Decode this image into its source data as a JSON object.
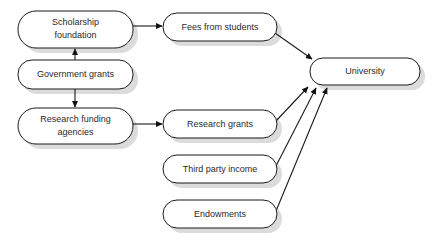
{
  "diagram": {
    "type": "flowchart",
    "background_color": "#ffffff",
    "node_fill_color": "#ffffff",
    "node_border_color": "#1b1b1b",
    "node_shadow_color": "#cfcfcf",
    "text_color": "#2a2a2a",
    "arrow_color": "#111111",
    "nodes": [
      {
        "id": "scholarship-foundation",
        "label_line1": "Scholarship",
        "label_line2": "foundation",
        "lines": 2,
        "x": 18,
        "y": 11,
        "width": 115,
        "height": 37,
        "radius": 18
      },
      {
        "id": "government-grants",
        "label_line1": "Government grants",
        "label_line2": "",
        "lines": 1,
        "x": 18,
        "y": 60,
        "width": 115,
        "height": 29,
        "radius": 14
      },
      {
        "id": "research-funding-agencies",
        "label_line1": "Research funding",
        "label_line2": "agencies",
        "lines": 2,
        "x": 18,
        "y": 108,
        "width": 115,
        "height": 36,
        "radius": 18
      },
      {
        "id": "fees-from-students",
        "label_line1": "Fees from students",
        "label_line2": "",
        "lines": 1,
        "x": 163,
        "y": 13,
        "width": 114,
        "height": 28,
        "radius": 14
      },
      {
        "id": "research-grants",
        "label_line1": "Research grants",
        "label_line2": "",
        "lines": 1,
        "x": 163,
        "y": 110,
        "width": 114,
        "height": 28,
        "radius": 14
      },
      {
        "id": "third-party-income",
        "label_line1": "Third party income",
        "label_line2": "",
        "lines": 1,
        "x": 163,
        "y": 155,
        "width": 114,
        "height": 28,
        "radius": 14
      },
      {
        "id": "endowments",
        "label_line1": "Endowments",
        "label_line2": "",
        "lines": 1,
        "x": 163,
        "y": 200,
        "width": 114,
        "height": 28,
        "radius": 14
      },
      {
        "id": "university",
        "label_line1": "University",
        "label_line2": "",
        "lines": 1,
        "x": 310,
        "y": 58,
        "width": 110,
        "height": 27,
        "radius": 13
      }
    ],
    "edges": [
      {
        "id": "government-grants-to-scholarship-foundation",
        "from": "government-grants",
        "to": "scholarship-foundation",
        "direction": "up",
        "x1": 75,
        "y1": 60,
        "x2": 75,
        "y2": 48
      },
      {
        "id": "government-grants-to-research-funding-agencies",
        "from": "government-grants",
        "to": "research-funding-agencies",
        "direction": "down",
        "x1": 75,
        "y1": 89,
        "x2": 75,
        "y2": 108
      },
      {
        "id": "scholarship-foundation-to-fees-from-students",
        "from": "scholarship-foundation",
        "to": "fees-from-students",
        "direction": "right",
        "x1": 133,
        "y1": 26,
        "x2": 163,
        "y2": 26
      },
      {
        "id": "research-funding-agencies-to-research-grants",
        "from": "research-funding-agencies",
        "to": "research-grants",
        "direction": "right",
        "x1": 133,
        "y1": 124,
        "x2": 163,
        "y2": 124
      },
      {
        "id": "fees-from-students-to-university",
        "from": "fees-from-students",
        "to": "university",
        "direction": "diagonal-down-right",
        "x1": 276,
        "y1": 34,
        "x2": 312,
        "y2": 59
      },
      {
        "id": "research-grants-to-university",
        "from": "research-grants",
        "to": "university",
        "direction": "diagonal-up-right",
        "x1": 276,
        "y1": 121,
        "x2": 309,
        "y2": 87
      },
      {
        "id": "third-party-income-to-university",
        "from": "third-party-income",
        "to": "university",
        "direction": "diagonal-up-right",
        "x1": 276,
        "y1": 167,
        "x2": 317,
        "y2": 88
      },
      {
        "id": "endowments-to-university",
        "from": "endowments",
        "to": "university",
        "direction": "diagonal-up-right",
        "x1": 276,
        "y1": 212,
        "x2": 328,
        "y2": 88
      }
    ]
  }
}
